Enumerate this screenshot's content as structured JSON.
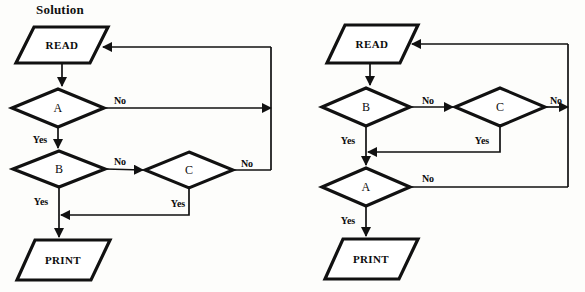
{
  "page": {
    "width": 585,
    "height": 292,
    "background": "#fdfdfb",
    "ink": "#111111"
  },
  "title": {
    "text": "Solution",
    "x": 36,
    "y": 2
  },
  "charts": [
    {
      "id": "left",
      "name": "left-flowchart",
      "nodes": [
        {
          "id": "read",
          "type": "parallelogram",
          "label": "READ",
          "cx": 62,
          "cy": 45,
          "w": 92,
          "h": 36,
          "slant": 18
        },
        {
          "id": "a",
          "type": "diamond",
          "label": "A",
          "cx": 58,
          "cy": 108,
          "w": 93,
          "h": 38
        },
        {
          "id": "b",
          "type": "diamond",
          "label": "B",
          "cx": 59,
          "cy": 169,
          "w": 92,
          "h": 37
        },
        {
          "id": "c",
          "type": "diamond",
          "label": "C",
          "cx": 189,
          "cy": 170,
          "w": 88,
          "h": 36
        },
        {
          "id": "print",
          "type": "parallelogram",
          "label": "PRINT",
          "cx": 63,
          "cy": 260,
          "w": 93,
          "h": 40,
          "slant": 18
        }
      ],
      "edge_labels": [
        {
          "id": "a-no",
          "text": "No",
          "x": 120,
          "y": 100
        },
        {
          "id": "a-yes",
          "text": "Yes",
          "x": 40,
          "y": 139
        },
        {
          "id": "b-no",
          "text": "No",
          "x": 120,
          "y": 161
        },
        {
          "id": "b-yes",
          "text": "Yes",
          "x": 41,
          "y": 201
        },
        {
          "id": "c-no",
          "text": "No",
          "x": 247,
          "y": 163
        },
        {
          "id": "c-yes",
          "text": "Yes",
          "x": 178,
          "y": 203
        }
      ]
    },
    {
      "id": "right",
      "name": "right-flowchart",
      "nodes": [
        {
          "id": "read",
          "type": "parallelogram",
          "label": "READ",
          "cx": 372,
          "cy": 44,
          "w": 91,
          "h": 37,
          "slant": 18
        },
        {
          "id": "b",
          "type": "diamond",
          "label": "B",
          "cx": 366,
          "cy": 107,
          "w": 90,
          "h": 37
        },
        {
          "id": "c",
          "type": "diamond",
          "label": "C",
          "cx": 500,
          "cy": 107,
          "w": 90,
          "h": 37
        },
        {
          "id": "a",
          "type": "diamond",
          "label": "A",
          "cx": 366,
          "cy": 187,
          "w": 90,
          "h": 37
        },
        {
          "id": "print",
          "type": "parallelogram",
          "label": "PRINT",
          "cx": 371,
          "cy": 259,
          "w": 93,
          "h": 40,
          "slant": 18
        }
      ],
      "edge_labels": [
        {
          "id": "b-no",
          "text": "No",
          "x": 428,
          "y": 100
        },
        {
          "id": "b-yes",
          "text": "Yes",
          "x": 348,
          "y": 140
        },
        {
          "id": "c-no",
          "text": "No",
          "x": 556,
          "y": 100
        },
        {
          "id": "c-yes",
          "text": "Yes",
          "x": 482,
          "y": 140
        },
        {
          "id": "a-no",
          "text": "No",
          "x": 428,
          "y": 178
        },
        {
          "id": "a-yes",
          "text": "Yes",
          "x": 348,
          "y": 220
        }
      ]
    }
  ]
}
